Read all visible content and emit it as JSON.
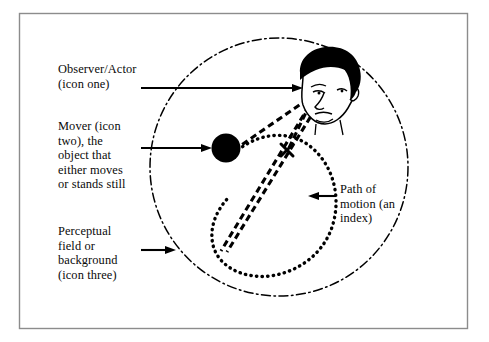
{
  "figure": {
    "frame": {
      "border_color": "#8c8c8c",
      "background": "#ffffff"
    },
    "ink_color": "#000000",
    "labels": [
      {
        "id": "observer",
        "text": "Observer/Actor\n(icon one)",
        "icon": "face-icon",
        "arrow": "arrow-right"
      },
      {
        "id": "mover",
        "text": "Mover (icon\ntwo), the\nobject that\neither moves\nor stands still",
        "icon": "filled-circle-icon",
        "arrow": "arrow-right"
      },
      {
        "id": "field",
        "text": "Perceptual\nfield or\nbackground\n(icon three)",
        "icon": "dash-dot-circle-icon",
        "arrow": "arrow-right"
      },
      {
        "id": "path",
        "text": "Path of\nmotion (an\nindex)",
        "icon": "dotted-loop-icon",
        "arrow": "arrow-left"
      }
    ],
    "elements": {
      "perceptual_field": {
        "name": "dash-dot-circle",
        "center_x": 279,
        "center_y": 167,
        "radius": 129,
        "stroke_style": "dash-dot"
      },
      "observer_head": {
        "name": "face-icon",
        "center_x": 327,
        "center_y": 86
      },
      "mover": {
        "name": "filled-circle-icon",
        "center_x": 226,
        "center_y": 148,
        "radius": 14
      },
      "path_of_motion": {
        "name": "dotted-loop",
        "stroke_style": "dotted"
      },
      "sight_lines": {
        "name": "dashed-sight-lines",
        "count": 3,
        "stroke_style": "dashed"
      },
      "fixation_mark": {
        "name": "x-mark",
        "x": 287,
        "y": 150
      }
    }
  }
}
